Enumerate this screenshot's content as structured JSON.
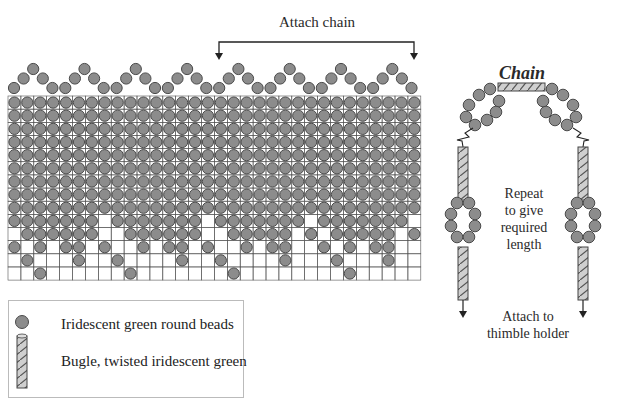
{
  "diagram": {
    "attach_chain_label": "Attach chain",
    "chain_title": "Chain",
    "repeat_label": [
      "Repeat",
      "to give",
      "required",
      "length"
    ],
    "thimble_label": [
      "Attach to",
      "thimble holder"
    ],
    "colors": {
      "bead_fill": "#8c8c8c",
      "bead_stroke": "#4a4a4a",
      "grid_line": "#555555",
      "bugle_fill": "#c8c8c8"
    },
    "grid": {
      "columns": 32,
      "rows": 14,
      "full_rows": 9,
      "empty_cells_by_row": {
        "9": [
          7,
          15,
          23,
          31
        ],
        "10": [
          0,
          7,
          8,
          15,
          16,
          22,
          24,
          30
        ],
        "11": [
          1,
          3,
          6,
          8,
          9,
          11,
          14,
          16,
          17,
          19,
          22,
          23,
          25,
          27,
          30,
          31
        ]
      },
      "sparse_rows": {
        "12": [
          1,
          5,
          8,
          13,
          16,
          21,
          25,
          29
        ],
        "13": [
          2,
          9,
          17,
          26
        ]
      }
    },
    "scallop_repeats": 8
  },
  "legend": {
    "items": [
      {
        "icon": "round-bead-icon",
        "label": "Iridescent green round beads"
      },
      {
        "icon": "twisted-bugle-icon",
        "label": "Bugle, twisted iridescent green"
      }
    ]
  }
}
